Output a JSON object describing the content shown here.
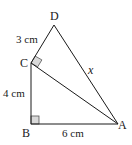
{
  "diagram": {
    "type": "geometry-triangles",
    "points": {
      "A": {
        "label": "A",
        "x": 118,
        "y": 124
      },
      "B": {
        "label": "B",
        "x": 31,
        "y": 124
      },
      "C": {
        "label": "C",
        "x": 31,
        "y": 63
      },
      "D": {
        "label": "D",
        "x": 54,
        "y": 25
      }
    },
    "segments": [
      {
        "from": "D",
        "to": "C",
        "label": "3 cm"
      },
      {
        "from": "C",
        "to": "B",
        "label": "4 cm"
      },
      {
        "from": "B",
        "to": "A",
        "label": "6 cm"
      },
      {
        "from": "D",
        "to": "A",
        "label": "x"
      },
      {
        "from": "C",
        "to": "A",
        "label": ""
      }
    ],
    "right_angles": [
      "B",
      "C"
    ],
    "labels": {
      "D": "D",
      "C": "C",
      "B": "B",
      "A": "A",
      "dc_length": "3 cm",
      "cb_length": "4 cm",
      "ba_length": "6 cm",
      "da_length": "x"
    },
    "colors": {
      "line": "#1a1a1a",
      "marker_fill": "#d9d9d9",
      "marker_stroke": "#555555"
    }
  }
}
